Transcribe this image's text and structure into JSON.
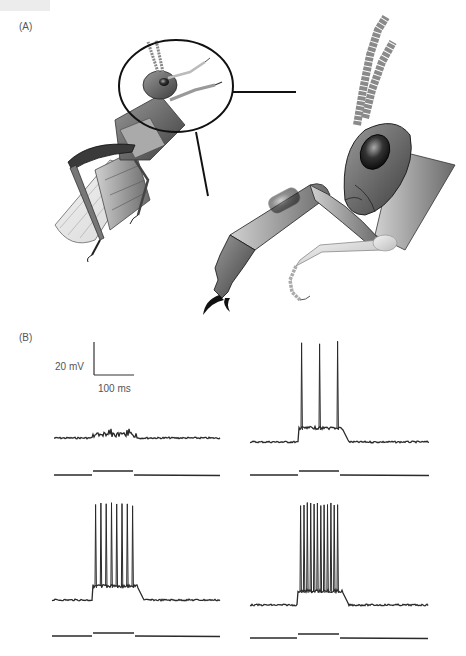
{
  "figure": {
    "panels": [
      {
        "id": "A",
        "label": "(A)",
        "content": "Grasshopper illustration with circled head/foreleg region enlarged"
      },
      {
        "id": "B",
        "label": "(B)",
        "content": "Four intracellular voltage recordings with stimulus traces"
      }
    ],
    "scale_bar": {
      "vertical_label": "20 mV",
      "horizontal_label": "100 ms"
    },
    "colors": {
      "trace": "#2a2a2a",
      "outline": "#111111",
      "body_dark": "#5a5a5a",
      "body_mid": "#8a8a8a",
      "body_light": "#c8c8c8"
    }
  },
  "chart_data": [
    {
      "type": "line",
      "title": "Recording 1 (top-left)",
      "description": "Subthreshold response: small depolarizing fluctuations during stimulus, no spikes",
      "spike_count": 0,
      "baseline_y_px": 438,
      "stimulus": {
        "start_px": 93,
        "end_px": 133,
        "baseline_y_px": 475,
        "step_y_px": 471
      },
      "x_range_px": [
        54,
        220
      ]
    },
    {
      "type": "line",
      "title": "Recording 2 (top-right)",
      "description": "Threshold response: 3 action potentials during stimulus",
      "spike_count": 3,
      "baseline_y_px": 442,
      "stimulus": {
        "start_px": 299,
        "end_px": 339,
        "baseline_y_px": 475,
        "step_y_px": 471
      },
      "x_range_px": [
        250,
        429
      ]
    },
    {
      "type": "line",
      "title": "Recording 3 (bottom-left)",
      "description": "Suprathreshold response: ~8 action potentials during stimulus",
      "spike_count": 8,
      "baseline_y_px": 600,
      "stimulus": {
        "start_px": 93,
        "end_px": 134,
        "baseline_y_px": 636,
        "step_y_px": 633
      },
      "x_range_px": [
        52,
        220
      ]
    },
    {
      "type": "line",
      "title": "Recording 4 (bottom-right)",
      "description": "Strong suprathreshold response: ~12 high-frequency action potentials during stimulus",
      "spike_count": 12,
      "baseline_y_px": 605,
      "stimulus": {
        "start_px": 298,
        "end_px": 339,
        "baseline_y_px": 638,
        "step_y_px": 634
      },
      "x_range_px": [
        250,
        428
      ]
    }
  ]
}
